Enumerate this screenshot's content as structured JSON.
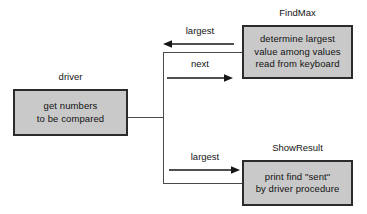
{
  "diagram": {
    "colors": {
      "box_fill": "#c9c9c9",
      "box_border": "#2b2b2b",
      "connector": "#4a4a4a",
      "arrow": "#161616",
      "text": "#141414",
      "background": "#ffffff"
    },
    "boxes": [
      {
        "id": "driver",
        "caption": "driver",
        "lines": [
          "get numbers",
          "to be compared"
        ]
      },
      {
        "id": "findmax",
        "caption": "FindMax",
        "lines": [
          "determine largest",
          "value among values",
          "read from keyboard"
        ]
      },
      {
        "id": "showresult",
        "caption": "ShowResult",
        "lines": [
          "print find \"sent\"",
          "by driver procedure"
        ]
      }
    ],
    "arrows": [
      {
        "id": "largest-return",
        "label": "largest",
        "direction": "left",
        "from": "findmax",
        "to": "driver"
      },
      {
        "id": "next",
        "label": "next",
        "direction": "right",
        "from": "driver",
        "to": "findmax"
      },
      {
        "id": "largest-send",
        "label": "largest",
        "direction": "right",
        "from": "driver",
        "to": "showresult"
      }
    ]
  }
}
